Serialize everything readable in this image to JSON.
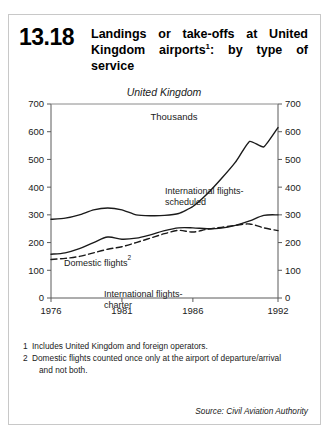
{
  "figure": {
    "number": "13.18",
    "title_line1": "Landings or take-offs at United",
    "title_line2_a": "Kingdom airports",
    "title_line2_sup": "1",
    "title_line2_b": ": by type of",
    "title_line3": "service",
    "title_full": "Landings or take-offs at United Kingdom airports1: by type of service"
  },
  "footnotes": [
    {
      "number": "1",
      "text": "Includes United Kingdom and foreign operators.",
      "continuation": ""
    },
    {
      "number": "2",
      "text": "Domestic flights counted once only at the airport of departure/arrival",
      "continuation": "and not both."
    }
  ],
  "source": "Source: Civil Aviation Authority",
  "chart_data": {
    "type": "line",
    "title": "United Kingdom",
    "subtitle": "Thousands",
    "xlabel": "",
    "ylabel": "Thousands",
    "xlim": [
      1976,
      1992
    ],
    "ylim": [
      0,
      700
    ],
    "ytick_values": [
      0,
      100,
      200,
      300,
      400,
      500,
      600,
      700
    ],
    "ytick_labels": [
      "0",
      "100",
      "200",
      "300",
      "400",
      "500",
      "600",
      "700"
    ],
    "xtick_values": [
      1976,
      1981,
      1986,
      1992
    ],
    "xtick_labels": [
      "1976",
      "1981",
      "1986",
      "1992"
    ],
    "grid": false,
    "legend": "inline-annotations",
    "dual_y_axis": true,
    "x": [
      1976,
      1977,
      1978,
      1979,
      1980,
      1981,
      1982,
      1983,
      1984,
      1985,
      1986,
      1987,
      1988,
      1989,
      1990,
      1991,
      1992
    ],
    "series": [
      {
        "name": "International flights-scheduled",
        "label": "International flights-",
        "label2": "scheduled",
        "style": "solid",
        "color": "#1a1a1a",
        "values": [
          284,
          288,
          300,
          318,
          325,
          318,
          300,
          297,
          298,
          305,
          330,
          375,
          430,
          490,
          565,
          545,
          615
        ]
      },
      {
        "name": "Domestic flights",
        "label": "Domestic flights",
        "label_sup": "2",
        "style": "solid",
        "color": "#1a1a1a",
        "values": [
          158,
          163,
          178,
          200,
          220,
          212,
          216,
          228,
          243,
          253,
          253,
          250,
          252,
          262,
          278,
          298,
          300
        ]
      },
      {
        "name": "International flights-charter",
        "label": "International flights-",
        "label2": "charter",
        "style": "dashed",
        "color": "#1a1a1a",
        "values": [
          139,
          143,
          150,
          163,
          176,
          185,
          200,
          216,
          232,
          244,
          238,
          248,
          255,
          262,
          267,
          253,
          243
        ]
      }
    ]
  }
}
